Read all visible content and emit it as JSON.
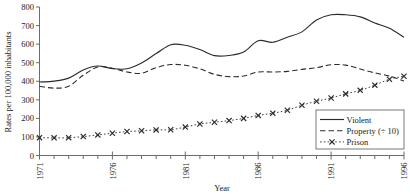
{
  "chart_data": {
    "type": "line",
    "title": "",
    "xlabel": "Year",
    "ylabel": "Rates per 100,000 inhabitants",
    "xlim": [
      1971,
      1996
    ],
    "ylim": [
      0,
      800
    ],
    "ytick_labels": [
      "0",
      "100",
      "200",
      "300",
      "400",
      "500",
      "600",
      "700",
      "800"
    ],
    "ytick_values": [
      0,
      100,
      200,
      300,
      400,
      500,
      600,
      700,
      800
    ],
    "xtick_labels": [
      "1971",
      "1976",
      "1981",
      "1986",
      "1991",
      "1996"
    ],
    "xtick_values": [
      1971,
      1976,
      1981,
      1986,
      1991,
      1996
    ],
    "xtick_minor_values": [
      1972,
      1973,
      1974,
      1975,
      1977,
      1978,
      1979,
      1980,
      1982,
      1983,
      1984,
      1985,
      1987,
      1988,
      1989,
      1990,
      1992,
      1993,
      1994,
      1995
    ],
    "grid": false,
    "legend_position": "lower right",
    "x": [
      1971,
      1972,
      1973,
      1974,
      1975,
      1976,
      1977,
      1978,
      1979,
      1980,
      1981,
      1982,
      1983,
      1984,
      1985,
      1986,
      1987,
      1988,
      1989,
      1990,
      1991,
      1992,
      1993,
      1994,
      1995,
      1996
    ],
    "series": [
      {
        "name": "Violent",
        "style": "solid",
        "marker": "none",
        "color": "#2b2b2b",
        "values": [
          396,
          401,
          417,
          461,
          482,
          468,
          467,
          498,
          549,
          597,
          594,
          571,
          538,
          539,
          557,
          618,
          610,
          637,
          666,
          730,
          758,
          758,
          747,
          714,
          685,
          637
        ]
      },
      {
        "name": "Property (÷ 10)",
        "style": "dashed",
        "marker": "none",
        "color": "#2b2b2b",
        "values": [
          373,
          363,
          373,
          432,
          477,
          470,
          450,
          443,
          473,
          490,
          486,
          467,
          437,
          425,
          428,
          450,
          450,
          453,
          464,
          473,
          489,
          487,
          466,
          445,
          428,
          401
        ]
      },
      {
        "name": "Prison",
        "style": "dotted",
        "marker": "x",
        "color": "#2b2b2b",
        "values": [
          96,
          95,
          96,
          102,
          111,
          120,
          129,
          133,
          138,
          139,
          153,
          170,
          179,
          188,
          200,
          216,
          228,
          244,
          271,
          292,
          310,
          332,
          351,
          379,
          411,
          427
        ]
      }
    ],
    "legend": [
      {
        "label": "Violent",
        "style": "solid",
        "marker": "none"
      },
      {
        "label": "Property (÷ 10)",
        "style": "dashed",
        "marker": "none"
      },
      {
        "label": "Prison",
        "style": "dotted",
        "marker": "x"
      }
    ]
  }
}
